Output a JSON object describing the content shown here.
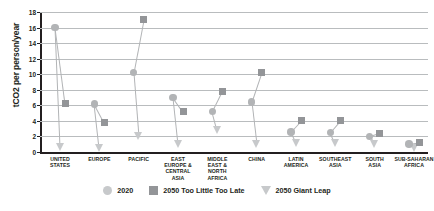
{
  "chart_data": {
    "type": "scatter",
    "title": "",
    "xlabel": "",
    "ylabel": "tCO2 per person/year",
    "ylim": [
      0,
      18
    ],
    "ytick_step": 2,
    "yticks": [
      0,
      2,
      4,
      6,
      8,
      10,
      12,
      14,
      16,
      18
    ],
    "grid": true,
    "legend_position": "bottom",
    "categories": [
      "UNITED STATES",
      "EUROPE",
      "PACIFIC",
      "EAST EUROPE & CENTRAL ASIA",
      "MIDDLE EAST & NORTH AFRICA",
      "CHINA",
      "LATIN AMERICA",
      "SOUTHEAST ASIA",
      "SOUTH ASIA",
      "SUB-SAHARAN AFRICA"
    ],
    "series": [
      {
        "name": "2020",
        "marker": "circle",
        "color": "#b2b4b6",
        "values": [
          16.0,
          6.2,
          10.2,
          7.0,
          5.2,
          6.4,
          2.6,
          2.5,
          2.0,
          1.0
        ]
      },
      {
        "name": "2050 Too Little Too Late",
        "marker": "square",
        "color": "#939598",
        "values": [
          6.2,
          3.8,
          17.0,
          5.2,
          7.8,
          10.2,
          4.0,
          4.0,
          2.4,
          1.2
        ]
      },
      {
        "name": "2050 Giant Leap",
        "marker": "triangle",
        "color": "#c7c9cb",
        "values": [
          0.6,
          0.5,
          2.0,
          1.0,
          2.8,
          1.0,
          1.2,
          1.2,
          1.0,
          0.5
        ]
      }
    ]
  },
  "axis": {
    "y_title": "tCO2 per person/year",
    "y_tick_labels": [
      "0",
      "2",
      "4",
      "6",
      "8",
      "10",
      "12",
      "14",
      "16",
      "18"
    ]
  },
  "x_labels": [
    [
      "UNITED",
      "STATES"
    ],
    [
      "EUROPE"
    ],
    [
      "PACIFIC"
    ],
    [
      "EAST",
      "EUROPE &",
      "CENTRAL",
      "ASIA"
    ],
    [
      "MIDDLE",
      "EAST &",
      "NORTH",
      "AFRICA"
    ],
    [
      "CHINA"
    ],
    [
      "LATIN",
      "AMERICA"
    ],
    [
      "SOUTHEAST",
      "ASIA"
    ],
    [
      "SOUTH",
      "ASIA"
    ],
    [
      "SUB-SAHARAN",
      "AFRICA"
    ]
  ],
  "legend": {
    "items": [
      {
        "label": "2020",
        "marker": "circle",
        "color": "#c7c9cb"
      },
      {
        "label": "2050 Too Little Too Late",
        "marker": "square",
        "color": "#939598"
      },
      {
        "label": "2050 Giant Leap",
        "marker": "triangle",
        "color": "#c7c9cb"
      }
    ]
  }
}
